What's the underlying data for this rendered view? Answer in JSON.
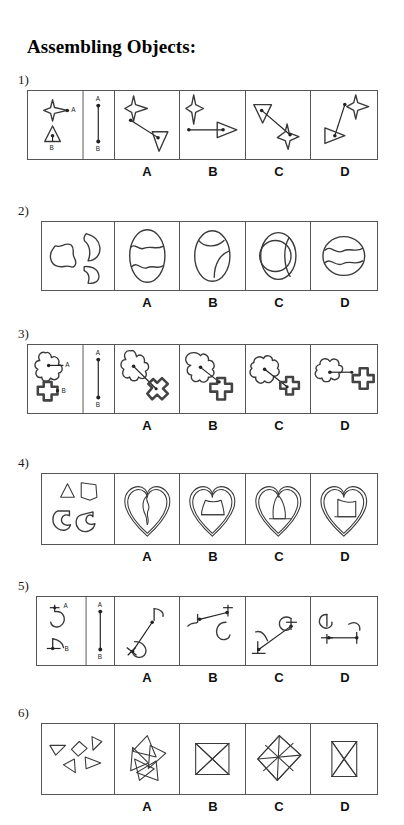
{
  "document": {
    "title": "Assembling Objects:"
  },
  "answer_labels": [
    "A",
    "B",
    "C",
    "D"
  ],
  "questions": [
    {
      "number": "1)",
      "type": "connection",
      "problem": {
        "shapes": [
          "four-pointed-star",
          "triangle"
        ],
        "point_labels": [
          "A",
          "B"
        ],
        "segment_labels": [
          "A",
          "B"
        ]
      }
    },
    {
      "number": "2)",
      "type": "puzzle",
      "problem": {
        "pieces": [
          "bowtie-blob",
          "crescent-blob",
          "small-crescent-blob"
        ],
        "assembled": "oval"
      }
    },
    {
      "number": "3)",
      "type": "connection",
      "problem": {
        "shapes": [
          "four-petal-flower",
          "plus-cross"
        ],
        "point_labels": [
          "A",
          "B"
        ],
        "segment_labels": [
          "A",
          "B"
        ]
      }
    },
    {
      "number": "4)",
      "type": "puzzle",
      "problem": {
        "pieces": [
          "triangle",
          "pentagon-blob",
          "crescent",
          "crescent-2"
        ],
        "assembled": "heart"
      }
    },
    {
      "number": "5)",
      "type": "connection",
      "problem": {
        "shapes": [
          "curl-c",
          "hook"
        ],
        "point_labels": [
          "A",
          "B"
        ],
        "segment_labels": [
          "A",
          "B"
        ]
      }
    },
    {
      "number": "6)",
      "type": "puzzle",
      "problem": {
        "pieces": [
          "triangle-1",
          "triangle-2",
          "triangle-3",
          "triangle-4",
          "diamond"
        ],
        "assembled": "star-square"
      }
    }
  ],
  "colors": {
    "ink": "#3a3a3a",
    "border": "#555555",
    "text": "#111111",
    "background": "#ffffff"
  }
}
